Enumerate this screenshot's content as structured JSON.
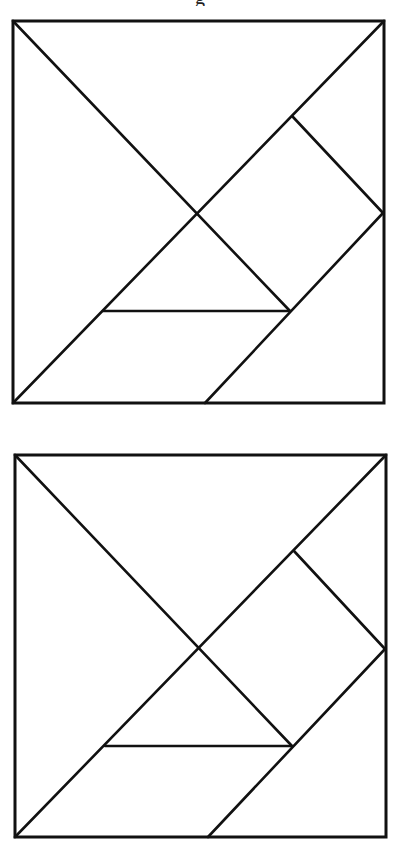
{
  "caption_fragment": "g",
  "diagram": {
    "type": "tangram",
    "stroke_color": "#111111",
    "background": "#ffffff",
    "panels": [
      {
        "name": "tangram-square-1",
        "outer": {
          "x1": 13,
          "y1": 21,
          "x2": 384,
          "y2": 403
        },
        "lines": [
          {
            "name": "diagonal-tl-to-center-junction",
            "x1": 13,
            "y1": 21,
            "x2": 290,
            "y2": 311
          },
          {
            "name": "diagonal-bl-to-tr",
            "x1": 13,
            "y1": 403,
            "x2": 384,
            "y2": 21
          },
          {
            "name": "square-piece-edge",
            "x1": 293,
            "y1": 117,
            "x2": 383,
            "y2": 213
          },
          {
            "name": "parallelogram-right-edge",
            "x1": 383,
            "y1": 213,
            "x2": 205,
            "y2": 403
          },
          {
            "name": "small-triangle-base",
            "x1": 103,
            "y1": 311,
            "x2": 290,
            "y2": 311
          }
        ]
      },
      {
        "name": "tangram-square-2",
        "outer": {
          "x1": 15,
          "y1": 455,
          "x2": 386,
          "y2": 837
        },
        "lines": [
          {
            "name": "diagonal-tl-to-center-junction",
            "x1": 15,
            "y1": 455,
            "x2": 292,
            "y2": 746
          },
          {
            "name": "diagonal-bl-to-tr",
            "x1": 15,
            "y1": 837,
            "x2": 386,
            "y2": 455
          },
          {
            "name": "square-piece-edge",
            "x1": 294,
            "y1": 551,
            "x2": 385,
            "y2": 649
          },
          {
            "name": "parallelogram-right-edge",
            "x1": 385,
            "y1": 649,
            "x2": 208,
            "y2": 837
          },
          {
            "name": "small-triangle-base",
            "x1": 105,
            "y1": 746,
            "x2": 292,
            "y2": 746
          }
        ]
      }
    ]
  }
}
